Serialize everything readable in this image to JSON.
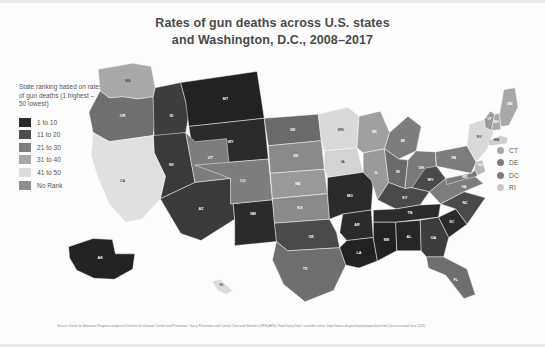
{
  "title": {
    "line1": "Rates of gun deaths across U.S. states",
    "line2": "and Washington, D.C., 2008–2017"
  },
  "legend": {
    "header": "State ranking based on rates of gun deaths (1 highest – 50 lowest)",
    "items": [
      {
        "label": "1 to 10",
        "color": "#2b2b2b"
      },
      {
        "label": "11 to 20",
        "color": "#4d4d4d"
      },
      {
        "label": "21 to 30",
        "color": "#7d7d7d"
      },
      {
        "label": "31 to 40",
        "color": "#a8a8a8"
      },
      {
        "label": "41 to 50",
        "color": "#dcdcdc"
      },
      {
        "label": "No Rank",
        "color": "#8f8f8f"
      }
    ]
  },
  "small_states_legend": {
    "items": [
      {
        "label": "CT",
        "color": "#a8a8a8"
      },
      {
        "label": "DE",
        "color": "#7d7d7d"
      },
      {
        "label": "DC",
        "color": "#7d7d7d"
      },
      {
        "label": "RI",
        "color": "#c8c8c8"
      }
    ]
  },
  "source": "Source: Center for American Progress analysis of Centers for Disease Control and Prevention, \"Injury Prevention and Control: Data and Statistics (WISQARS): Fatal Injury Data\" available online: https://www.cdc.gov/injury/wisqars/fatal.html (last accessed June 2019)",
  "chart_data": {
    "type": "map",
    "title": "Rates of gun deaths across U.S. states and Washington, D.C., 2008–2017",
    "legend_title": "State ranking based on rates of gun deaths (1 highest – 50 lowest)",
    "bins": [
      "1 to 10",
      "11 to 20",
      "21 to 30",
      "31 to 40",
      "41 to 50",
      "No Rank"
    ],
    "bin_colors": [
      "#2b2b2b",
      "#4d4d4d",
      "#7d7d7d",
      "#a8a8a8",
      "#dcdcdc",
      "#8f8f8f"
    ],
    "states": [
      {
        "code": "WA",
        "bin": "31 to 40",
        "color": "#a8a8a8",
        "label_style": "dk"
      },
      {
        "code": "OR",
        "bin": "21 to 30",
        "color": "#6f6f6f",
        "label_style": "lt"
      },
      {
        "code": "ID",
        "bin": "11 to 20",
        "color": "#3d3d3d",
        "label_style": "lt"
      },
      {
        "code": "MT",
        "bin": "1 to 10",
        "color": "#222222",
        "label_style": "lt"
      },
      {
        "code": "WY",
        "bin": "1 to 10",
        "color": "#2b2b2b",
        "label_style": "lt"
      },
      {
        "code": "NV",
        "bin": "11 to 20",
        "color": "#3a3a3a",
        "label_style": "lt"
      },
      {
        "code": "UT",
        "bin": "21 to 30",
        "color": "#7d7d7d",
        "label_style": "lt"
      },
      {
        "code": "CA",
        "bin": "41 to 50",
        "color": "#e0e0e0",
        "label_style": "dk"
      },
      {
        "code": "AZ",
        "bin": "11 to 20",
        "color": "#3a3a3a",
        "label_style": "lt"
      },
      {
        "code": "NM",
        "bin": "1 to 10",
        "color": "#2b2b2b",
        "label_style": "lt"
      },
      {
        "code": "CO",
        "bin": "21 to 30",
        "color": "#7d7d7d",
        "label_style": "lt"
      },
      {
        "code": "ND",
        "bin": "21 to 30",
        "color": "#6a6a6a",
        "label_style": "lt"
      },
      {
        "code": "SD",
        "bin": "21 to 30",
        "color": "#8a8a8a",
        "label_style": "lt"
      },
      {
        "code": "NE",
        "bin": "31 to 40",
        "color": "#9a9a9a",
        "label_style": "lt"
      },
      {
        "code": "KS",
        "bin": "21 to 30",
        "color": "#8a8a8a",
        "label_style": "lt"
      },
      {
        "code": "OK",
        "bin": "11 to 20",
        "color": "#4a4a4a",
        "label_style": "lt"
      },
      {
        "code": "TX",
        "bin": "21 to 30",
        "color": "#6f6f6f",
        "label_style": "lt"
      },
      {
        "code": "MN",
        "bin": "41 to 50",
        "color": "#d9d9d9",
        "label_style": "dk"
      },
      {
        "code": "IA",
        "bin": "41 to 50",
        "color": "#d3d3d3",
        "label_style": "dk"
      },
      {
        "code": "MO",
        "bin": "1 to 10",
        "color": "#2b2b2b",
        "label_style": "lt"
      },
      {
        "code": "AR",
        "bin": "1 to 10",
        "color": "#2b2b2b",
        "label_style": "lt"
      },
      {
        "code": "LA",
        "bin": "1 to 10",
        "color": "#222222",
        "label_style": "lt"
      },
      {
        "code": "WI",
        "bin": "31 to 40",
        "color": "#a0a0a0",
        "label_style": "lt"
      },
      {
        "code": "IL",
        "bin": "31 to 40",
        "color": "#9a9a9a",
        "label_style": "lt"
      },
      {
        "code": "MI",
        "bin": "21 to 30",
        "color": "#7d7d7d",
        "label_style": "lt"
      },
      {
        "code": "IN",
        "bin": "21 to 30",
        "color": "#6a6a6a",
        "label_style": "lt"
      },
      {
        "code": "OH",
        "bin": "21 to 30",
        "color": "#7a7a7a",
        "label_style": "lt"
      },
      {
        "code": "KY",
        "bin": "11 to 20",
        "color": "#4a4a4a",
        "label_style": "lt"
      },
      {
        "code": "TN",
        "bin": "1 to 10",
        "color": "#2b2b2b",
        "label_style": "lt"
      },
      {
        "code": "MS",
        "bin": "1 to 10",
        "color": "#222222",
        "label_style": "lt"
      },
      {
        "code": "AL",
        "bin": "1 to 10",
        "color": "#262626",
        "label_style": "lt"
      },
      {
        "code": "GA",
        "bin": "11 to 20",
        "color": "#3d3d3d",
        "label_style": "lt"
      },
      {
        "code": "FL",
        "bin": "21 to 30",
        "color": "#6f6f6f",
        "label_style": "lt"
      },
      {
        "code": "SC",
        "bin": "1 to 10",
        "color": "#2b2b2b",
        "label_style": "lt"
      },
      {
        "code": "NC",
        "bin": "11 to 20",
        "color": "#4a4a4a",
        "label_style": "lt"
      },
      {
        "code": "VA",
        "bin": "21 to 30",
        "color": "#7d7d7d",
        "label_style": "lt"
      },
      {
        "code": "WV",
        "bin": "11 to 20",
        "color": "#4a4a4a",
        "label_style": "lt"
      },
      {
        "code": "MD",
        "bin": "21 to 30",
        "color": "#7a7a7a",
        "label_style": "lt"
      },
      {
        "code": "PA",
        "bin": "21 to 30",
        "color": "#7d7d7d",
        "label_style": "lt"
      },
      {
        "code": "NJ",
        "bin": "41 to 50",
        "color": "#b8b8b8",
        "label_style": "lt"
      },
      {
        "code": "NY",
        "bin": "41 to 50",
        "color": "#d9d9d9",
        "label_style": "dk"
      },
      {
        "code": "VT",
        "bin": "31 to 40",
        "color": "#9a9a9a",
        "label_style": "lt"
      },
      {
        "code": "NH",
        "bin": "31 to 40",
        "color": "#a8a8a8",
        "label_style": "lt"
      },
      {
        "code": "MA",
        "bin": "41 to 50",
        "color": "#cfcfcf",
        "label_style": "dk"
      },
      {
        "code": "ME",
        "bin": "31 to 40",
        "color": "#a8a8a8",
        "label_style": "lt"
      },
      {
        "code": "CT",
        "bin": "41 to 50",
        "color": "#c8c8c8",
        "label_style": "dk"
      },
      {
        "code": "DE",
        "bin": "21 to 30",
        "color": "#7d7d7d",
        "label_style": "lt"
      },
      {
        "code": "DC",
        "bin": "No Rank",
        "color": "#7d7d7d",
        "label_style": "lt"
      },
      {
        "code": "RI",
        "bin": "41 to 50",
        "color": "#c8c8c8",
        "label_style": "dk"
      },
      {
        "code": "AK",
        "bin": "1 to 10",
        "color": "#222222",
        "label_style": "lt"
      },
      {
        "code": "HI",
        "bin": "41 to 50",
        "color": "#dcdcdc",
        "label_style": "dk"
      }
    ]
  }
}
